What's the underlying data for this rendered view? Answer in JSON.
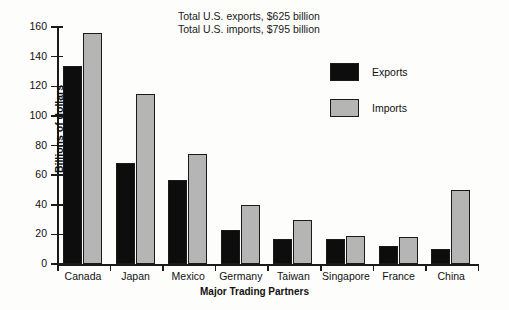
{
  "chart_data": {
    "type": "bar",
    "title": "",
    "xlabel": "Major Trading Partners",
    "ylabel": "Billions of dollars",
    "ylim": [
      0,
      160
    ],
    "ytick_interval": 20,
    "yticks": [
      0,
      20,
      40,
      60,
      80,
      100,
      120,
      140,
      160
    ],
    "grid": false,
    "legend_position": "top-right",
    "categories": [
      "Canada",
      "Japan",
      "Mexico",
      "Germany",
      "Taiwan",
      "Singapore",
      "France",
      "China"
    ],
    "series": [
      {
        "name": "Exports",
        "color": "#0d0d0d",
        "values": [
          134,
          68,
          57,
          23,
          17,
          17,
          12,
          10
        ]
      },
      {
        "name": "Imports",
        "color": "#b5b5b5",
        "values": [
          156,
          115,
          74,
          40,
          30,
          19,
          18,
          50
        ]
      }
    ],
    "annotations": [
      "Total U.S. exports, $625 billion",
      "Total U.S. imports, $795 billion"
    ]
  }
}
